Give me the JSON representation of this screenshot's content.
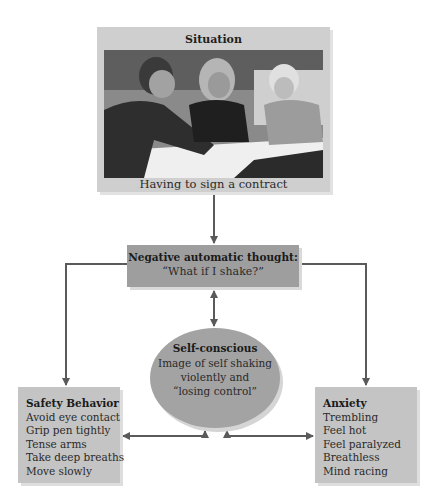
{
  "diagram": {
    "situation": {
      "title": "Situation",
      "photo_alt": "Three people leaning over a table looking at a document",
      "caption": "Having to sign a contract"
    },
    "negative_thought": {
      "title": "Negative automatic thought:",
      "quote": "“What if I shake?”"
    },
    "self_conscious": {
      "title": "Self-conscious",
      "lines": [
        "Image of self shaking",
        "violently and",
        "“losing control”"
      ]
    },
    "safety_behavior": {
      "title": "Safety Behavior",
      "items": [
        "Avoid eye contact",
        "Grip pen tightly",
        "Tense arms",
        "Take deep breaths",
        "Move slowly"
      ]
    },
    "anxiety": {
      "title": "Anxiety",
      "items": [
        "Trembling",
        "Feel hot",
        "Feel paralyzed",
        "Breathless",
        "Mind racing"
      ]
    },
    "colors": {
      "arrow": "#5a5a5a",
      "situation_bg": "#cfcfcf",
      "thought_bg": "#9e9e9e",
      "ellipse_bg": "#a3a3a3",
      "side_bg": "#c4c4c4"
    }
  }
}
